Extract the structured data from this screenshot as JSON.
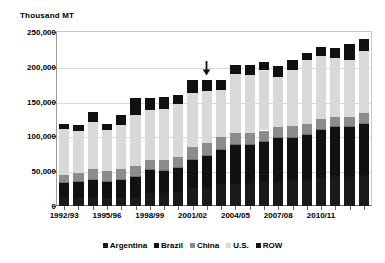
{
  "chart_data": {
    "type": "bar",
    "subtype": "stacked-column",
    "title": "Thousand MT",
    "xlabel": "",
    "ylabel": "Thousand MT",
    "ylim": [
      0,
      250000
    ],
    "ytick_labels": [
      "0",
      "50,000",
      "100,000",
      "150,000",
      "200,000",
      "250,000"
    ],
    "ytick_values": [
      0,
      50000,
      100000,
      150000,
      200000,
      250000
    ],
    "grid": true,
    "legend_position": "bottom",
    "categories": [
      "1992/93",
      "1993/94",
      "1994/95",
      "1995/96",
      "1996/97",
      "1997/98",
      "1998/99",
      "1999/00",
      "2000/01",
      "2001/02",
      "2002/03",
      "2003/04",
      "2004/05",
      "2005/06",
      "2006/07",
      "2007/08",
      "2008/09",
      "2009/10",
      "2010/11",
      "2011/12",
      "2012/13",
      "2013/14"
    ],
    "xtick_labels_shown": [
      "1992/93",
      "1995/96",
      "1998/99",
      "2001/02",
      "2004/05",
      "2007/08",
      "2010/11"
    ],
    "series": [
      {
        "name": "Argentina",
        "color": "#1a1a1a",
        "values": [
          11500,
          12000,
          12500,
          12000,
          11000,
          11000,
          18000,
          19000,
          20000,
          26500,
          27500,
          31500,
          31000,
          33000,
          34500,
          34000,
          38000,
          37500,
          40000,
          41000,
          41000,
          44000
        ]
      },
      {
        "name": "Brazil",
        "color": "#111111",
        "values": [
          22500,
          24500,
          26000,
          24500,
          28500,
          31500,
          34500,
          33000,
          35500,
          41500,
          46500,
          50500,
          57500,
          56000,
          58500,
          64500,
          61000,
          65500,
          70500,
          73500,
          74000,
          75000
        ]
      },
      {
        "name": "China",
        "color": "#8c8c8c",
        "values": [
          10500,
          11000,
          14000,
          13500,
          13000,
          14500,
          14000,
          14500,
          15500,
          16500,
          16000,
          17500,
          16500,
          16000,
          15500,
          14500,
          15500,
          15000,
          15000,
          13500,
          13000,
          14000
        ]
      },
      {
        "name": "U.S.",
        "color": "#d9d9d9",
        "values": [
          66000,
          60500,
          68500,
          59000,
          64500,
          73500,
          72000,
          72500,
          75000,
          78500,
          75500,
          66500,
          85000,
          83500,
          87000,
          72500,
          80500,
          91500,
          90500,
          84000,
          82500,
          89500
        ]
      },
      {
        "name": "ROW",
        "color": "#111111",
        "values": [
          7500,
          8000,
          14500,
          8500,
          13500,
          24500,
          17000,
          17000,
          13000,
          18000,
          15500,
          14500,
          12000,
          13500,
          11000,
          15000,
          15500,
          11000,
          12500,
          15500,
          22500,
          17500
        ]
      }
    ],
    "totals": [
      118000,
      116000,
      135500,
      117500,
      130500,
      155000,
      155500,
      156000,
      159000,
      181000,
      181000,
      180500,
      202000,
      202000,
      206500,
      200500,
      210500,
      220500,
      228500,
      227500,
      233000,
      240000
    ],
    "annotation": {
      "type": "down-arrow",
      "at_category": "2002/03",
      "label": ""
    }
  },
  "legend": {
    "items": [
      {
        "label": "Argentina",
        "color": "#1a1a1a"
      },
      {
        "label": "Brazil",
        "color": "#111111"
      },
      {
        "label": "China",
        "color": "#8c8c8c"
      },
      {
        "label": "U.S.",
        "color": "#d9d9d9"
      },
      {
        "label": "ROW",
        "color": "#111111"
      }
    ]
  }
}
